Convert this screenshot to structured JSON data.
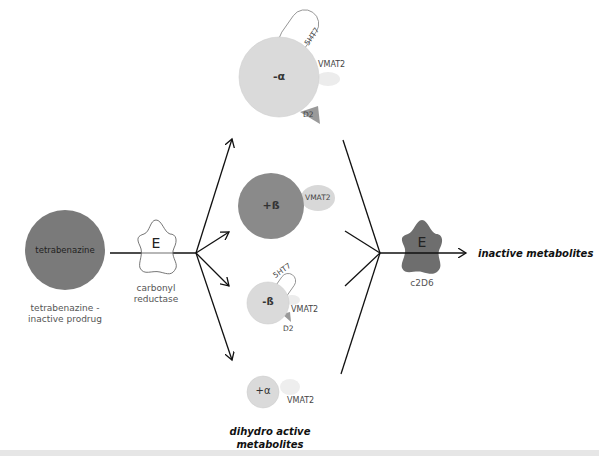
{
  "prodrug": {
    "circle_label": "tetrabenazine",
    "caption_line1": "tetrabenazine -",
    "caption_line2": "inactive prodrug",
    "color": "#7a7a7a"
  },
  "enzyme1": {
    "symbol": "E",
    "caption_line1": "carbonyl",
    "caption_line2": "reductase"
  },
  "metabolites": [
    {
      "label": "-α",
      "color": "#dadada",
      "receptors": [
        "5HT7",
        "VMAT2",
        "D2"
      ]
    },
    {
      "label": "+ß",
      "color": "#8a8a8a",
      "receptors": [
        "VMAT2"
      ]
    },
    {
      "label": "-ß",
      "color": "#dadada",
      "receptors": [
        "5HT7",
        "VMAT2",
        "D2"
      ]
    },
    {
      "label": "+α",
      "color": "#dadada",
      "receptors": [
        "VMAT2"
      ]
    }
  ],
  "metabolites_caption_line1": "dihydro active",
  "metabolites_caption_line2": "metabolites",
  "enzyme2": {
    "symbol": "E",
    "caption": "c2D6",
    "color": "#6e6e6e"
  },
  "output_label": "inactive metabolites"
}
